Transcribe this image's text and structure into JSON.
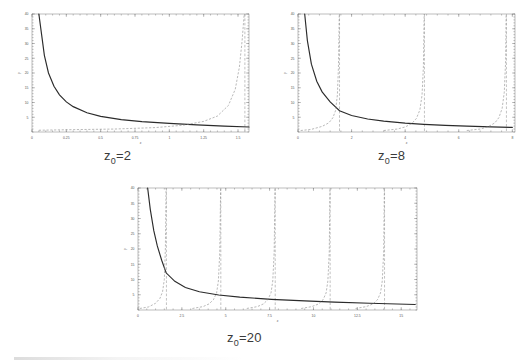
{
  "figure": {
    "kind": "three-panel scientific plot",
    "axis_labels": {
      "x": "x",
      "y": "y"
    }
  },
  "panels": [
    {
      "caption_prefix": "z",
      "caption_sub": "0",
      "caption_suffix": "=2",
      "caption_full": "z0=2"
    },
    {
      "caption_prefix": "z",
      "caption_sub": "0",
      "caption_suffix": "=8",
      "caption_full": "z0=8"
    },
    {
      "caption_prefix": "z",
      "caption_sub": "0",
      "caption_suffix": "=20",
      "caption_full": "z0=20"
    }
  ],
  "chart_data": [
    {
      "type": "line",
      "title": "z0=2",
      "xlabel": "x",
      "ylabel": "y",
      "xlim": [
        0,
        1.58
      ],
      "ylim": [
        0,
        40
      ],
      "grid": false,
      "legend": "none",
      "xticks": [
        0,
        0.25,
        0.5,
        0.75,
        1,
        1.25,
        1.5
      ],
      "xticklabels": [
        "0",
        "0.25",
        "0.5",
        "0.75",
        "1",
        "1.25",
        "1.5"
      ],
      "yticks": [
        5,
        10,
        15,
        20,
        25,
        30,
        35,
        40
      ],
      "yticklabels": [
        "5",
        "10",
        "15",
        "20",
        "25",
        "30",
        "35",
        "40"
      ],
      "series": [
        {
          "name": "solid decaying branch",
          "style": "solid",
          "note": "hyperbola-like y = z0/x falling from y=40 near x=0.05 toward y~1.3 at x=1.58",
          "x": [
            0.05,
            0.07,
            0.09,
            0.12,
            0.16,
            0.2,
            0.25,
            0.3,
            0.4,
            0.5,
            0.65,
            0.8,
            1.0,
            1.2,
            1.4,
            1.58
          ],
          "y": [
            40,
            33,
            26,
            20,
            15.5,
            12.6,
            10.2,
            8.6,
            6.5,
            5.3,
            4.2,
            3.5,
            2.9,
            2.4,
            2.0,
            1.7
          ]
        },
        {
          "name": "dashed tangent branch 1",
          "style": "dashed",
          "asymptote_x": 1.55,
          "x": [
            0.05,
            0.3,
            0.6,
            0.9,
            1.1,
            1.25,
            1.35,
            1.43,
            1.48,
            1.51,
            1.53,
            1.545
          ],
          "y": [
            0.6,
            0.8,
            1.0,
            1.5,
            2.3,
            3.6,
            5.4,
            9.0,
            14.5,
            22,
            31,
            40
          ]
        }
      ],
      "asymptotes_x": [
        1.55
      ]
    },
    {
      "type": "line",
      "title": "z0=8",
      "xlabel": "x",
      "ylabel": "y",
      "xlim": [
        0,
        8.1
      ],
      "ylim": [
        0,
        40
      ],
      "grid": false,
      "legend": "none",
      "xticks": [
        0,
        2,
        4,
        6,
        8
      ],
      "xticklabels": [
        "0",
        "2",
        "4",
        "6",
        "8"
      ],
      "yticks": [
        5,
        10,
        15,
        20,
        25,
        30,
        35,
        40
      ],
      "yticklabels": [
        "5",
        "10",
        "15",
        "20",
        "25",
        "30",
        "35",
        "40"
      ],
      "series": [
        {
          "name": "solid decaying branch",
          "style": "solid",
          "note": "falls from y=40 near x=0.25 crossing y~7 at x=1.55 toward y~1.3 at x=8",
          "x": [
            0.25,
            0.35,
            0.5,
            0.7,
            0.9,
            1.2,
            1.55,
            2.0,
            2.6,
            3.2,
            4.0,
            4.7,
            5.5,
            6.3,
            7.2,
            8.0
          ],
          "y": [
            40,
            31,
            23,
            17.2,
            13.6,
            10.2,
            7.2,
            5.6,
            4.4,
            3.7,
            3.0,
            2.6,
            2.25,
            2.0,
            1.75,
            1.55
          ]
        },
        {
          "name": "dashed tangent branch 1",
          "style": "dashed",
          "asymptote_x": 1.55,
          "x": [
            0.1,
            0.5,
            0.9,
            1.15,
            1.3,
            1.4,
            1.47,
            1.51,
            1.54
          ],
          "y": [
            0.5,
            0.9,
            1.9,
            3.1,
            4.8,
            7.2,
            12.5,
            22,
            40
          ]
        },
        {
          "name": "dashed tangent branch 2",
          "style": "dashed",
          "asymptote_x": 4.72,
          "x": [
            3.2,
            3.7,
            4.0,
            4.25,
            4.42,
            4.55,
            4.63,
            4.68,
            4.71
          ],
          "y": [
            0.5,
            1.0,
            1.7,
            2.9,
            4.6,
            7.5,
            12.5,
            22,
            40
          ]
        },
        {
          "name": "dashed tangent branch 3",
          "style": "dashed",
          "asymptote_x": 7.78,
          "x": [
            6.3,
            6.8,
            7.1,
            7.35,
            7.5,
            7.62,
            7.7,
            7.75,
            7.77
          ],
          "y": [
            0.5,
            1.0,
            1.8,
            3.1,
            4.9,
            8.0,
            13.5,
            24,
            40
          ]
        }
      ],
      "asymptotes_x": [
        1.55,
        4.72,
        7.78
      ]
    },
    {
      "type": "line",
      "title": "z0=20",
      "xlabel": "x",
      "ylabel": "y",
      "xlim": [
        0,
        15.9
      ],
      "ylim": [
        0,
        40
      ],
      "grid": false,
      "legend": "none",
      "xticks": [
        0,
        2.5,
        5,
        7.5,
        10,
        12.5,
        15
      ],
      "xticklabels": [
        "0",
        "2.5",
        "5",
        "7.5",
        "10",
        "12.5",
        "15"
      ],
      "yticks": [
        5,
        10,
        15,
        20,
        25,
        30,
        35,
        40
      ],
      "yticklabels": [
        "5",
        "10",
        "15",
        "20",
        "25",
        "30",
        "35",
        "40"
      ],
      "series": [
        {
          "name": "solid decaying branch",
          "style": "solid",
          "note": "falls from y=40 near x=0.55 crossing y~12 at x=1.6 toward y~1.6 at x=15.8",
          "x": [
            0.55,
            0.7,
            0.9,
            1.1,
            1.35,
            1.6,
            2.1,
            2.7,
            3.5,
            4.6,
            5.8,
            7.6,
            9.5,
            11.2,
            13.2,
            15.8
          ],
          "y": [
            40,
            33,
            26,
            21,
            16.3,
            12.2,
            9.4,
            7.4,
            6.0,
            4.9,
            4.2,
            3.5,
            3.0,
            2.6,
            2.2,
            1.8
          ]
        },
        {
          "name": "dashed tangent branch 1",
          "style": "dashed",
          "asymptote_x": 1.62,
          "x": [
            0.1,
            0.6,
            1.0,
            1.25,
            1.4,
            1.5,
            1.56,
            1.6
          ],
          "y": [
            0.5,
            1.0,
            2.2,
            3.8,
            6.0,
            10.0,
            20,
            40
          ]
        },
        {
          "name": "dashed tangent branch 2",
          "style": "dashed",
          "asymptote_x": 4.72,
          "x": [
            3.1,
            3.7,
            4.05,
            4.3,
            4.48,
            4.58,
            4.66,
            4.71
          ],
          "y": [
            0.5,
            1.1,
            2.0,
            3.4,
            5.6,
            9.5,
            19,
            40
          ]
        },
        {
          "name": "dashed tangent branch 3",
          "style": "dashed",
          "asymptote_x": 7.82,
          "x": [
            6.2,
            6.8,
            7.15,
            7.4,
            7.58,
            7.68,
            7.76,
            7.81
          ],
          "y": [
            0.5,
            1.1,
            2.0,
            3.4,
            5.6,
            9.5,
            19,
            40
          ]
        },
        {
          "name": "dashed tangent branch 4",
          "style": "dashed",
          "asymptote_x": 10.95,
          "x": [
            9.3,
            9.9,
            10.3,
            10.55,
            10.72,
            10.82,
            10.9,
            10.94
          ],
          "y": [
            0.5,
            1.1,
            2.0,
            3.4,
            5.6,
            9.5,
            19,
            40
          ]
        },
        {
          "name": "dashed tangent branch 5",
          "style": "dashed",
          "asymptote_x": 14.05,
          "x": [
            12.4,
            13.0,
            13.4,
            13.65,
            13.82,
            13.92,
            14.0,
            14.04
          ],
          "y": [
            0.5,
            1.1,
            2.0,
            3.4,
            5.6,
            9.5,
            19,
            40
          ]
        }
      ],
      "asymptotes_x": [
        1.62,
        4.72,
        7.82,
        10.95,
        14.05
      ]
    }
  ]
}
